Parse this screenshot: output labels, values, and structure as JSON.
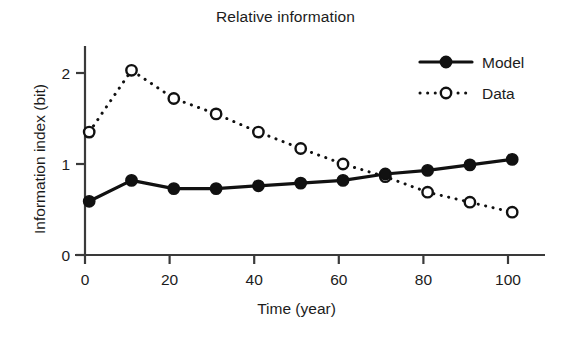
{
  "chart_data": {
    "type": "line",
    "title": "Relative information",
    "xlabel": "Time (year)",
    "ylabel": "Information index (bit)",
    "x": [
      1,
      11,
      21,
      31,
      41,
      51,
      61,
      71,
      81,
      91,
      101
    ],
    "xlim": [
      0,
      105
    ],
    "ylim": [
      0,
      2.3
    ],
    "xticks": [
      0,
      20,
      40,
      60,
      80,
      100
    ],
    "xtick_labels": [
      "0",
      "20",
      "40",
      "60",
      "80",
      "100"
    ],
    "yticks": [
      0,
      1,
      2
    ],
    "ytick_labels": [
      "0",
      "1",
      "2"
    ],
    "grid": false,
    "legend_position": "top-right",
    "series": [
      {
        "name": "Model",
        "values": [
          0.59,
          0.82,
          0.73,
          0.73,
          0.76,
          0.79,
          0.82,
          0.89,
          0.93,
          0.99,
          1.05
        ],
        "line_style": "solid",
        "marker": "filled-circle",
        "color": "#111111"
      },
      {
        "name": "Data",
        "values": [
          1.35,
          2.03,
          1.72,
          1.55,
          1.35,
          1.17,
          1.0,
          0.86,
          0.69,
          0.58,
          0.47
        ],
        "line_style": "dotted",
        "marker": "open-circle",
        "color": "#111111"
      }
    ]
  },
  "legend": {
    "entries": [
      {
        "label": "Model"
      },
      {
        "label": "Data"
      }
    ]
  },
  "axes": {
    "axis_color": "#3a3a3a"
  }
}
